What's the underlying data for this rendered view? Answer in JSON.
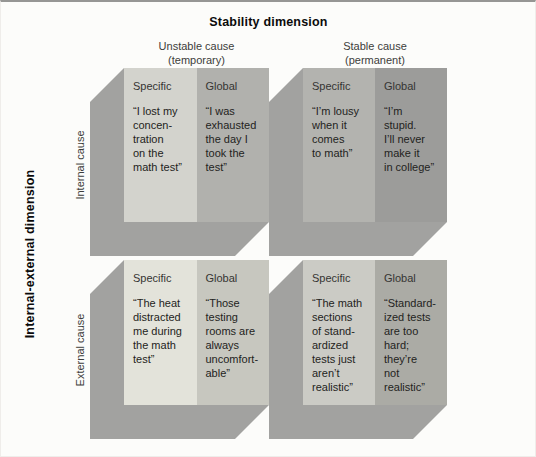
{
  "title": "Stability dimension",
  "dimension_label": "Internal-external dimension",
  "columns": [
    {
      "name": "Unstable cause",
      "sub": "(temporary)"
    },
    {
      "name": "Stable cause",
      "sub": "(permanent)"
    }
  ],
  "rows": [
    {
      "label": "Internal cause"
    },
    {
      "label": "External cause"
    }
  ],
  "colors": {
    "background": "#fcfcfa",
    "slab": "#a2a2a0",
    "text": "#232321"
  },
  "quadrants": [
    {
      "row": "Internal cause",
      "column": "Unstable cause",
      "specific": {
        "label": "Specific",
        "color": "#d3d3cd",
        "quote": [
          "“I lost my",
          "concen-",
          "tration",
          "on the",
          "math test”"
        ]
      },
      "global": {
        "label": "Global",
        "color": "#b1b1ad",
        "quote": [
          "“I was",
          "exhausted",
          "the day I",
          "took the",
          "test”"
        ]
      }
    },
    {
      "row": "Internal cause",
      "column": "Stable cause",
      "specific": {
        "label": "Specific",
        "color": "#b3b3af",
        "quote": [
          "“I’m lousy",
          "when it",
          "comes",
          "to math”"
        ]
      },
      "global": {
        "label": "Global",
        "color": "#9c9c9a",
        "quote": [
          "“I’m",
          "stupid.",
          "I’ll never",
          "make it",
          "in college”"
        ]
      }
    },
    {
      "row": "External cause",
      "column": "Unstable cause",
      "specific": {
        "label": "Specific",
        "color": "#e3e3da",
        "quote": [
          "“The heat",
          "distracted",
          "me during",
          "the math",
          "test”"
        ]
      },
      "global": {
        "label": "Global",
        "color": "#c7c7bf",
        "quote": [
          "“Those",
          "testing",
          "rooms are",
          "always",
          "uncomfort-",
          "able”"
        ]
      }
    },
    {
      "row": "External cause",
      "column": "Stable cause",
      "specific": {
        "label": "Specific",
        "color": "#cbcbc5",
        "quote": [
          "“The math",
          "sections",
          "of stand-",
          "ardized",
          "tests just",
          "aren’t",
          "realistic”"
        ]
      },
      "global": {
        "label": "Global",
        "color": "#ababa5",
        "quote": [
          "“Standard-",
          "ized tests",
          "are too",
          "hard;",
          "they’re",
          "not",
          "realistic”"
        ]
      }
    }
  ]
}
